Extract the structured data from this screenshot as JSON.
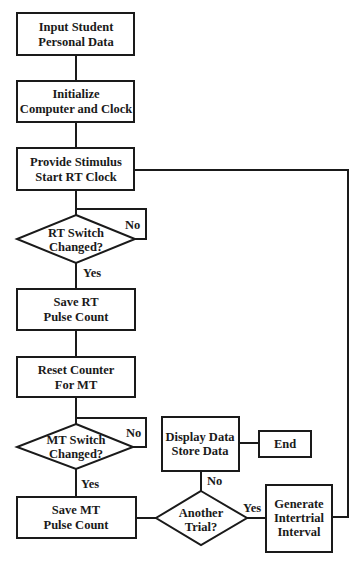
{
  "diagram": {
    "type": "flowchart",
    "nodes": [
      {
        "id": "input_student",
        "shape": "rect",
        "lines": [
          "Input Student",
          "Personal Data"
        ]
      },
      {
        "id": "initialize",
        "shape": "rect",
        "lines": [
          "Initialize",
          "Computer and Clock"
        ]
      },
      {
        "id": "provide_stimulus",
        "shape": "rect",
        "lines": [
          "Provide Stimulus",
          "Start RT Clock"
        ]
      },
      {
        "id": "rt_switch",
        "shape": "diamond",
        "lines": [
          "RT Switch",
          "Changed?"
        ]
      },
      {
        "id": "save_rt",
        "shape": "rect",
        "lines": [
          "Save RT",
          "Pulse Count"
        ]
      },
      {
        "id": "reset_counter",
        "shape": "rect",
        "lines": [
          "Reset Counter",
          "For MT"
        ]
      },
      {
        "id": "mt_switch",
        "shape": "diamond",
        "lines": [
          "MT Switch",
          "Changed?"
        ]
      },
      {
        "id": "save_mt",
        "shape": "rect",
        "lines": [
          "Save MT",
          "Pulse Count"
        ]
      },
      {
        "id": "another_trial",
        "shape": "diamond",
        "lines": [
          "Another",
          "Trial?"
        ]
      },
      {
        "id": "display_data",
        "shape": "rect",
        "lines": [
          "Display Data",
          "Store Data"
        ]
      },
      {
        "id": "end",
        "shape": "rect",
        "lines": [
          "End"
        ]
      },
      {
        "id": "generate_interval",
        "shape": "rect",
        "lines": [
          "Generate",
          "Intertrial",
          "Interval"
        ]
      }
    ],
    "edges": [
      {
        "from": "input_student",
        "to": "initialize",
        "label": ""
      },
      {
        "from": "initialize",
        "to": "provide_stimulus",
        "label": ""
      },
      {
        "from": "provide_stimulus",
        "to": "rt_switch",
        "label": ""
      },
      {
        "from": "rt_switch",
        "to": "rt_switch",
        "label": "No"
      },
      {
        "from": "rt_switch",
        "to": "save_rt",
        "label": "Yes"
      },
      {
        "from": "save_rt",
        "to": "reset_counter",
        "label": ""
      },
      {
        "from": "reset_counter",
        "to": "mt_switch",
        "label": ""
      },
      {
        "from": "mt_switch",
        "to": "mt_switch",
        "label": "No"
      },
      {
        "from": "mt_switch",
        "to": "save_mt",
        "label": "Yes"
      },
      {
        "from": "save_mt",
        "to": "another_trial",
        "label": ""
      },
      {
        "from": "another_trial",
        "to": "display_data",
        "label": "No"
      },
      {
        "from": "display_data",
        "to": "end",
        "label": ""
      },
      {
        "from": "another_trial",
        "to": "generate_interval",
        "label": "Yes"
      },
      {
        "from": "generate_interval",
        "to": "provide_stimulus",
        "label": ""
      }
    ]
  },
  "labels": {
    "rt_no": "No",
    "rt_yes": "Yes",
    "mt_no": "No",
    "mt_yes": "Yes",
    "trial_no": "No",
    "trial_yes": "Yes"
  },
  "text": {
    "input_student": [
      "Input Student",
      "Personal Data"
    ],
    "initialize": [
      "Initialize",
      "Computer and Clock"
    ],
    "provide_stimulus": [
      "Provide Stimulus",
      "Start RT Clock"
    ],
    "rt_switch": [
      "RT Switch",
      "Changed?"
    ],
    "save_rt": [
      "Save RT",
      "Pulse Count"
    ],
    "reset_counter": [
      "Reset Counter",
      "For MT"
    ],
    "mt_switch": [
      "MT Switch",
      "Changed?"
    ],
    "save_mt": [
      "Save MT",
      "Pulse Count"
    ],
    "another_trial": [
      "Another",
      "Trial?"
    ],
    "display_data": [
      "Display Data",
      "Store Data"
    ],
    "end": [
      "End"
    ],
    "generate_interval": [
      "Generate",
      "Intertrial",
      "Interval"
    ]
  },
  "colors": {
    "stroke": "#1a1a1a",
    "background": "#ffffff"
  }
}
